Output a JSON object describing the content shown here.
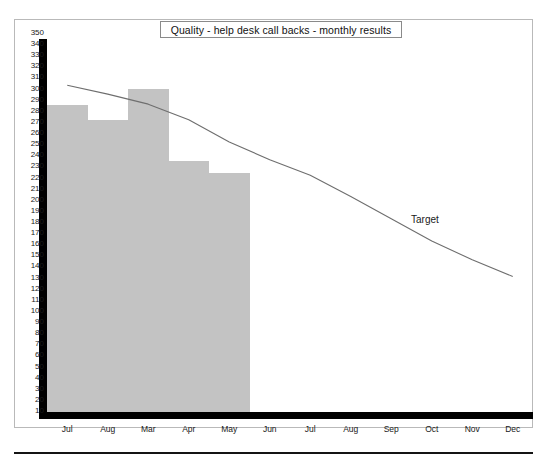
{
  "figure": {
    "title": "Quality - help desk call backs - monthly results",
    "target_annotation": "Target",
    "bar_color": "#c3c3c3",
    "line_color": "#6e6e6e",
    "axis_color": "#000000",
    "frame_color": "#b9b9b9"
  },
  "chart_data": {
    "type": "bar",
    "title": "Quality - help desk call backs - monthly results",
    "xlabel": "",
    "ylabel": "",
    "ylim": [
      0,
      350
    ],
    "ytick_step": 10,
    "grid": false,
    "legend_position": "none",
    "categories": [
      "Jul",
      "Aug",
      "Mar",
      "Apr",
      "May",
      "Jun",
      "Jul",
      "Aug",
      "Sep",
      "Oct",
      "Nov",
      "Dec"
    ],
    "ytick_labels": [
      "350",
      "340",
      "330",
      "320",
      "310",
      "300",
      "290",
      "280",
      "270",
      "260",
      "250",
      "240",
      "230",
      "220",
      "210",
      "200",
      "190",
      "180",
      "170",
      "160",
      "150",
      "140",
      "130",
      "120",
      "110",
      "100",
      "90",
      "80",
      "70",
      "60",
      "50",
      "40",
      "30",
      "20",
      "10"
    ],
    "series": [
      {
        "name": "Monthly results",
        "type": "bar",
        "values": [
          285,
          272,
          300,
          235,
          224,
          null,
          null,
          null,
          null,
          null,
          null,
          null
        ]
      },
      {
        "name": "Target",
        "type": "line",
        "values": [
          303,
          295,
          286,
          272,
          252,
          236,
          222,
          203,
          183,
          163,
          146,
          131
        ]
      }
    ],
    "annotations": [
      {
        "text": "Target",
        "x_category": "Sep",
        "y": 205
      }
    ]
  }
}
